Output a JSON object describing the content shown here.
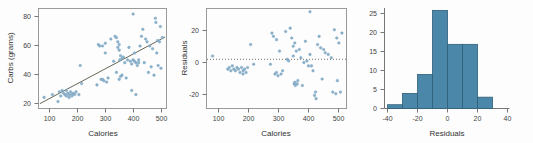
{
  "figure": {
    "background": "#fdfdfd",
    "point_color": "#8fb3cc",
    "bar_color": "#4a87a8",
    "bar_edge_color": "#2f5f79",
    "regression_line_color": "#555544"
  },
  "panels": [
    {
      "name": "scatter-carbs-vs-calories"
    },
    {
      "name": "residuals-vs-calories"
    },
    {
      "name": "histogram-of-residuals"
    }
  ],
  "chart_data": [
    {
      "type": "scatter",
      "title": "",
      "xlabel": "Calories",
      "ylabel": "Carbs (grams)",
      "xlim": [
        60,
        520
      ],
      "ylim": [
        12,
        84
      ],
      "xticks": [
        100,
        200,
        300,
        400,
        500
      ],
      "yticks": [
        20,
        40,
        60,
        80
      ],
      "grid": false,
      "legend": "none",
      "annotations": [
        "least-squares regression line drawn through points"
      ],
      "trendline": {
        "type": "linear",
        "x0": 65,
        "y0": 15.5,
        "x1": 515,
        "y1": 63.5
      },
      "x": [
        80,
        110,
        130,
        135,
        140,
        145,
        150,
        155,
        160,
        160,
        165,
        170,
        170,
        175,
        180,
        180,
        185,
        190,
        195,
        205,
        210,
        215,
        270,
        275,
        280,
        285,
        290,
        290,
        295,
        300,
        300,
        305,
        310,
        320,
        330,
        335,
        340,
        340,
        345,
        345,
        350,
        350,
        350,
        352,
        355,
        355,
        360,
        360,
        365,
        370,
        375,
        380,
        385,
        390,
        395,
        395,
        400,
        400,
        405,
        405,
        410,
        410,
        415,
        420,
        420,
        425,
        430,
        435,
        440,
        445,
        450,
        455,
        460,
        465,
        470,
        475,
        480,
        482,
        485,
        488,
        490,
        495,
        498,
        500,
        505
      ],
      "y": [
        20,
        22,
        17,
        24,
        21,
        25,
        23,
        22,
        25,
        21,
        23,
        22,
        20,
        24,
        22,
        21,
        23,
        22,
        24,
        22,
        43,
        30,
        29,
        58,
        57,
        33,
        33,
        57,
        32,
        52,
        59,
        31,
        34,
        62,
        46,
        64,
        63,
        38,
        60,
        56,
        58,
        54,
        33,
        47,
        50,
        35,
        36,
        48,
        49,
        45,
        34,
        47,
        56,
        46,
        44,
        25,
        80,
        47,
        46,
        52,
        45,
        22,
        43,
        45,
        47,
        57,
        64,
        69,
        45,
        62,
        60,
        38,
        57,
        42,
        55,
        36,
        77,
        74,
        52,
        61,
        43,
        60,
        71,
        41,
        63
      ]
    },
    {
      "type": "scatter",
      "title": "",
      "xlabel": "Calories",
      "ylabel": "Residuals",
      "xlim": [
        60,
        520
      ],
      "ylim": [
        -30,
        31
      ],
      "xticks": [
        100,
        200,
        300,
        400,
        500
      ],
      "yticks": [
        -20,
        0,
        20
      ],
      "grid": false,
      "legend": "none",
      "annotations": [
        "dotted horizontal reference line at residual = 0"
      ],
      "reference_line_y": 0,
      "x": [
        80,
        130,
        135,
        140,
        145,
        150,
        155,
        160,
        165,
        170,
        175,
        180,
        180,
        185,
        190,
        195,
        205,
        215,
        270,
        275,
        280,
        285,
        290,
        290,
        295,
        300,
        305,
        310,
        320,
        325,
        330,
        335,
        340,
        345,
        345,
        348,
        350,
        350,
        352,
        355,
        358,
        360,
        365,
        370,
        375,
        380,
        385,
        390,
        395,
        400,
        400,
        405,
        410,
        415,
        418,
        420,
        425,
        430,
        435,
        440,
        445,
        450,
        460,
        470,
        475,
        480,
        485,
        488,
        490,
        495,
        500,
        505
      ],
      "y": [
        2,
        -6,
        -5,
        -7,
        -4,
        -6,
        -7,
        -5,
        -6,
        -8,
        -5,
        -7,
        -9,
        -6,
        -8,
        -5,
        9,
        -3,
        -3,
        16,
        14,
        -9,
        -8,
        12,
        -10,
        5,
        -9,
        -7,
        17,
        0,
        -1,
        19,
        13,
        8,
        2,
        -15,
        10,
        -14,
        -16,
        5,
        -15,
        -13,
        6,
        1,
        -16,
        -2,
        11,
        -1,
        -4,
        29,
        3,
        -4,
        -7,
        -22,
        -20,
        -24,
        9,
        14,
        7,
        -12,
        6,
        4,
        3,
        1,
        -20,
        18,
        -21,
        13,
        -13,
        10,
        -20,
        16
      ]
    },
    {
      "type": "bar",
      "subtype": "histogram",
      "title": "",
      "xlabel": "Residuals",
      "ylabel": "",
      "xlim": [
        -40,
        40
      ],
      "ylim": [
        0,
        26.5
      ],
      "xticks": [
        -40,
        -20,
        0,
        20,
        40
      ],
      "yticks": [
        0,
        5,
        10,
        15,
        20,
        25
      ],
      "grid": false,
      "legend": "none",
      "bin_width": 10,
      "bin_edges": [
        -40,
        -30,
        -20,
        -10,
        0,
        10,
        20,
        30
      ],
      "categories": [
        "-40 to -30",
        "-30 to -20",
        "-20 to -10",
        "-10 to 0",
        "0 to 10",
        "10 to 20",
        "20 to 30"
      ],
      "values": [
        1,
        4,
        9,
        26,
        17,
        17,
        3
      ]
    }
  ]
}
